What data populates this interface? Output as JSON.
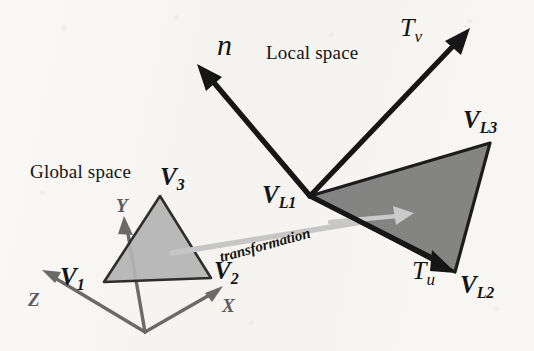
{
  "figure": {
    "background_color": "#f7f6f3",
    "ink_color": "#141414",
    "axis_color": "#5d5d5d",
    "global_triangle_fill": "#b8b8b8",
    "local_triangle_fill": "#7e7e7e",
    "transformation_arrow_color": "#c8c8c8"
  },
  "labels": {
    "global_space": "Global space",
    "local_space": "Local space",
    "transformation": "transformation",
    "normal_vector": "n",
    "tangent_v": "T",
    "tangent_v_sub": "v",
    "tangent_u": "T",
    "tangent_u_sub": "u",
    "axis_x": "X",
    "axis_y": "Y",
    "axis_z": "Z",
    "v1": "V",
    "v1_sub": "1",
    "v2": "V",
    "v2_sub": "2",
    "v3": "V",
    "v3_sub": "3",
    "vl1": "V",
    "vl1_sub": "L1",
    "vl2": "V",
    "vl2_sub": "L2",
    "vl3": "V",
    "vl3_sub": "L3"
  },
  "geometry": {
    "global_origin": [
      145,
      332
    ],
    "global_triangle": [
      [
        104,
        282
      ],
      [
        211,
        278
      ],
      [
        160,
        196
      ]
    ],
    "axis_x_tip": [
      221,
      287
    ],
    "axis_y_tip": [
      124,
      219
    ],
    "axis_z_tip": [
      44,
      272
    ],
    "local_triangle": [
      [
        310,
        196
      ],
      [
        455,
        272
      ],
      [
        490,
        143
      ]
    ],
    "normal_arrow": [
      [
        310,
        196
      ],
      [
        200,
        67
      ]
    ],
    "tangent_v_arrow": [
      [
        310,
        196
      ],
      [
        467,
        31
      ]
    ],
    "tangent_u_arrow": [
      [
        310,
        196
      ],
      [
        456,
        273
      ]
    ],
    "transformation_arrow": [
      [
        175,
        252
      ],
      [
        412,
        213
      ]
    ]
  }
}
